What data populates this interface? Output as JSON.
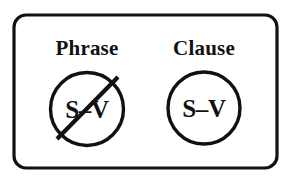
{
  "figure": {
    "background_color": "#ffffff",
    "stroke_color": "#111111",
    "frame": {
      "shape": "rounded-rectangle",
      "x": 14,
      "y": 15,
      "width": 263,
      "height": 153,
      "corner_radius": 12,
      "stroke_width": 3.2
    },
    "panels": [
      {
        "id": "phrase",
        "label": "Phrase",
        "label_x": 87,
        "label_y": 55,
        "circle": {
          "cx": 87,
          "cy": 109,
          "r": 36.5
        },
        "inner_text": "S–V",
        "inner_text_x": 87,
        "inner_text_y": 118,
        "negated": true,
        "slash": {
          "x1": 57,
          "y1": 139,
          "x2": 118,
          "y2": 77
        }
      },
      {
        "id": "clause",
        "label": "Clause",
        "label_x": 204,
        "label_y": 55,
        "circle": {
          "cx": 204,
          "cy": 108,
          "r": 36.0
        },
        "inner_text": "S–V",
        "inner_text_x": 204,
        "inner_text_y": 117,
        "negated": false,
        "slash": null
      }
    ]
  }
}
